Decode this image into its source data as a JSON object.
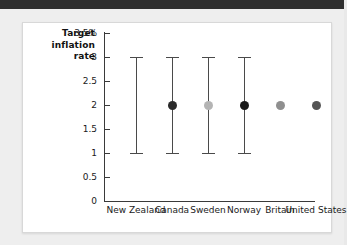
{
  "figure": {
    "axis_title": "Target\ninflation\nrate",
    "axis_title_line1": "Target",
    "axis_title_line2": "inflation",
    "axis_title_line3": "rate"
  },
  "chart_data": {
    "type": "scatter",
    "title": "",
    "subtitle": "",
    "xlabel": "",
    "ylabel": "Target inflation rate",
    "ylim": [
      0,
      3.5
    ],
    "yticks": [
      0,
      0.5,
      1,
      1.5,
      2,
      2.5,
      3,
      3.5
    ],
    "ytick_labels": [
      "0",
      "0.5",
      "1",
      "1.5",
      "2",
      "2.5",
      "3",
      "3.5%"
    ],
    "grid": false,
    "legend": "none",
    "units": "percent",
    "categories": [
      "New Zealand",
      "Canada",
      "Sweden",
      "Norway",
      "Britain",
      "United States"
    ],
    "series": [
      {
        "name": "Target inflation rate",
        "points": [
          {
            "category": "New Zealand",
            "value": null,
            "low": 1.0,
            "high": 3.0,
            "has_range": true,
            "has_point": false,
            "color": "#222222"
          },
          {
            "category": "Canada",
            "value": 2.0,
            "low": 1.0,
            "high": 3.0,
            "has_range": true,
            "has_point": true,
            "color": "#2a2a2a"
          },
          {
            "category": "Sweden",
            "value": 2.0,
            "low": 1.0,
            "high": 3.0,
            "has_range": true,
            "has_point": true,
            "color": "#b4b4b4"
          },
          {
            "category": "Norway",
            "value": 2.0,
            "low": 1.0,
            "high": 3.0,
            "has_range": true,
            "has_point": true,
            "color": "#1a1a1a"
          },
          {
            "category": "Britain",
            "value": 2.0,
            "low": null,
            "high": null,
            "has_range": false,
            "has_point": true,
            "color": "#8f8f8f"
          },
          {
            "category": "United States",
            "value": 2.0,
            "low": null,
            "high": null,
            "has_range": false,
            "has_point": true,
            "color": "#555555"
          }
        ]
      }
    ]
  }
}
